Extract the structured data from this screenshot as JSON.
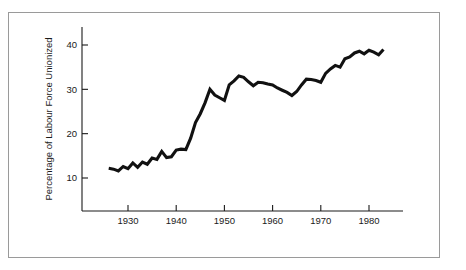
{
  "figure": {
    "border_color": "#9a9a9a",
    "background": "#ffffff"
  },
  "chart_data": {
    "type": "line",
    "title": "",
    "subtitle": "",
    "xlabel": "",
    "ylabel": "Percentage of Labour Force Unionized",
    "xlim": [
      1925,
      1985
    ],
    "ylim": [
      0,
      44
    ],
    "grid": false,
    "legend": null,
    "line_color": "#111111",
    "line_width": 3.1,
    "x_ticks": [
      1930,
      1940,
      1950,
      1960,
      1970,
      1980
    ],
    "x_tick_labels": [
      "1930",
      "1940",
      "1950",
      "1960",
      "1970",
      "1980"
    ],
    "y_ticks": [
      10,
      20,
      30,
      40
    ],
    "y_tick_labels": [
      "10",
      "20",
      "30",
      "40"
    ],
    "series": [
      {
        "name": "Percentage of Labour Force Unionized",
        "x": [
          1926,
          1927,
          1928,
          1929,
          1930,
          1931,
          1932,
          1933,
          1934,
          1935,
          1936,
          1937,
          1938,
          1939,
          1940,
          1941,
          1942,
          1943,
          1944,
          1945,
          1946,
          1947,
          1948,
          1949,
          1950,
          1951,
          1952,
          1953,
          1954,
          1955,
          1956,
          1957,
          1958,
          1959,
          1960,
          1961,
          1962,
          1963,
          1964,
          1965,
          1966,
          1967,
          1968,
          1969,
          1970,
          1971,
          1972,
          1973,
          1974,
          1975,
          1976,
          1977,
          1978,
          1979,
          1980,
          1981,
          1982,
          1983
        ],
        "values": [
          12.2,
          12.0,
          11.6,
          12.6,
          12.1,
          13.4,
          12.4,
          13.6,
          13.1,
          14.5,
          14.2,
          16.0,
          14.6,
          14.8,
          16.3,
          16.5,
          16.4,
          19.0,
          22.5,
          24.5,
          27.0,
          30.0,
          28.7,
          28.1,
          27.5,
          31.0,
          31.9,
          33.0,
          32.7,
          31.7,
          30.8,
          31.6,
          31.5,
          31.2,
          31.0,
          30.3,
          29.8,
          29.3,
          28.6,
          29.5,
          31.0,
          32.3,
          32.2,
          32.0,
          31.6,
          33.6,
          34.6,
          35.4,
          35.0,
          36.9,
          37.3,
          38.2,
          38.6,
          38.0,
          38.8,
          38.4,
          37.8,
          39.0
        ]
      }
    ]
  }
}
